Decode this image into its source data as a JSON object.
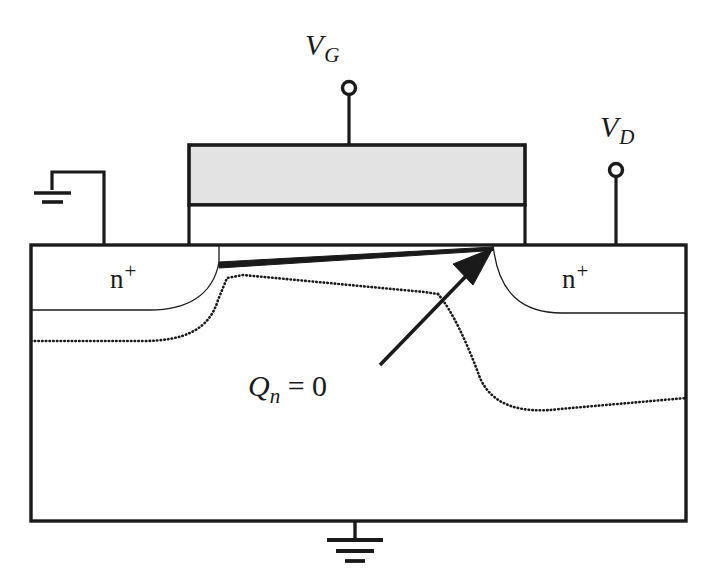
{
  "figure": {
    "type": "mosfet-cross-section-diagram",
    "background_color": "#ffffff",
    "line_color": "#1a1a1a",
    "gate_fill_color": "#e3e3e3"
  },
  "labels": {
    "gate_voltage": {
      "symbol": "V",
      "subscript": "G",
      "full": "VG"
    },
    "drain_voltage": {
      "symbol": "V",
      "subscript": "D",
      "full": "VD"
    },
    "source_region": {
      "base": "n",
      "superscript": "+",
      "full": "n+"
    },
    "drain_region": {
      "base": "n",
      "superscript": "+",
      "full": "n+"
    },
    "pinchoff_annotation": {
      "symbol": "Q",
      "subscript": "n",
      "rest": " = 0",
      "full": "Qn = 0"
    }
  },
  "terminals": [
    {
      "name": "gate-terminal",
      "label": "VG",
      "x": 349,
      "y": 88
    },
    {
      "name": "drain-terminal",
      "label": "VD",
      "x": 616,
      "y": 170
    },
    {
      "name": "source-ground",
      "label": "ground",
      "x": 52,
      "y": 193
    },
    {
      "name": "body-ground",
      "label": "ground",
      "x": 355,
      "y": 540
    }
  ],
  "regions": [
    {
      "name": "gate-electrode",
      "fill": "#e3e3e3",
      "x": 189,
      "y": 145,
      "width": 336,
      "height": 60
    },
    {
      "name": "gate-oxide",
      "fill": "#ffffff",
      "x": 189,
      "y": 205,
      "width": 336,
      "height": 40
    },
    {
      "name": "substrate",
      "fill": "#ffffff",
      "x": 31,
      "y": 245,
      "width": 655,
      "height": 276
    }
  ],
  "annotations": {
    "channel_line_name": "inversion-channel-line",
    "arrow_name": "pinchoff-arrow",
    "source_depletion_name": "source-depletion-boundary",
    "drain_depletion_name": "drain-depletion-boundary"
  }
}
